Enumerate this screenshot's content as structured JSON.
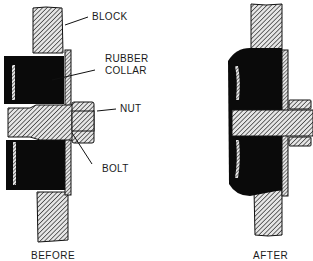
{
  "figure": {
    "before": {
      "caption": "BEFORE",
      "labels": {
        "block": "BLOCK",
        "rubber_collar_line1": "RUBBER",
        "rubber_collar_line2": "COLLAR",
        "nut": "NUT",
        "bolt": "BOLT"
      }
    },
    "after": {
      "caption": "AFTER"
    }
  },
  "colors": {
    "ink": "#111111",
    "hatch": "#222222",
    "hatch_bg": "#e6e6e6",
    "rubber": "#0a0a0a",
    "paper": "#ffffff"
  }
}
